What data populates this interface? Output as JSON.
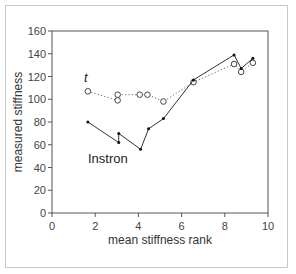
{
  "chart_data": {
    "type": "line",
    "title": "",
    "xlabel": "mean stiffness rank",
    "ylabel": "measured stiffness",
    "xlim": [
      0,
      10
    ],
    "ylim": [
      0,
      160
    ],
    "xticks": [
      0,
      2,
      4,
      6,
      8,
      10
    ],
    "yticks": [
      0,
      20,
      40,
      60,
      80,
      100,
      120,
      140,
      160
    ],
    "grid": false,
    "legend": "inline labels",
    "series": [
      {
        "name": "t",
        "style": "dotted line, open circle markers",
        "label_italic": true,
        "x": [
          1.66,
          3.04,
          3.04,
          4.06,
          4.42,
          5.16,
          6.55,
          8.43,
          8.76,
          9.3
        ],
        "y": [
          107,
          99,
          104,
          104,
          104,
          98,
          115,
          131,
          124,
          132
        ]
      },
      {
        "name": "Instron",
        "style": "solid line, small filled markers",
        "x": [
          1.66,
          3.09,
          3.09,
          4.1,
          4.47,
          5.16,
          6.55,
          8.43,
          8.76,
          9.3
        ],
        "y": [
          80,
          62,
          70,
          56,
          74,
          83,
          117,
          139,
          127,
          136
        ]
      }
    ]
  },
  "colors": {
    "axis": "#555555",
    "line": "#333333",
    "frame": "#c8c8c8"
  }
}
